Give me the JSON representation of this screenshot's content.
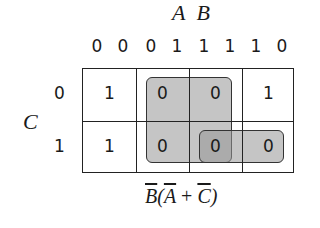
{
  "diagram": {
    "type": "karnaugh-map",
    "column_variable_label": "A B",
    "column_codes": [
      "0 0",
      "0 1",
      "1 1",
      "1 0"
    ],
    "column_code_digits": [
      "0",
      "0",
      "0",
      "1",
      "1",
      "1",
      "1",
      "0"
    ],
    "row_variable_label": "C",
    "row_codes": [
      "0",
      "1"
    ],
    "cells": [
      [
        "1",
        "0",
        "0",
        "1"
      ],
      [
        "1",
        "0",
        "0",
        "0"
      ]
    ],
    "groups": [
      {
        "name": "group-1",
        "cells": [
          [
            0,
            1
          ],
          [
            0,
            2
          ],
          [
            1,
            1
          ],
          [
            1,
            2
          ]
        ],
        "term": "B̄ Ā"
      },
      {
        "name": "group-2",
        "cells": [
          [
            1,
            2
          ],
          [
            1,
            3
          ]
        ],
        "term": "B̄ C̄"
      }
    ],
    "expression": {
      "b": "B",
      "open": "(",
      "a": "A",
      "plus": " + ",
      "c": "C",
      "close": ")"
    },
    "shade_color": "#a0a0a0",
    "line_color": "#222222"
  }
}
